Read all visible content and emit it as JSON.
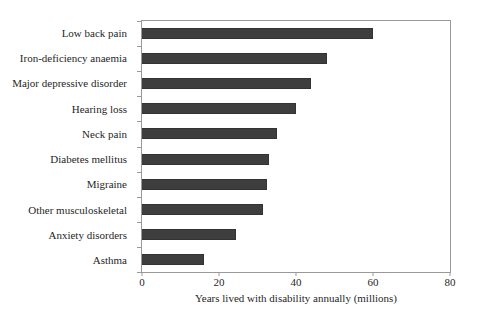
{
  "figure": {
    "background": "#ffffff",
    "text_color": "#1f1f1f"
  },
  "chart_data": {
    "type": "bar",
    "orientation": "horizontal",
    "title": "",
    "xlabel": "Years lived with disability annually (millions)",
    "ylabel": "",
    "categories": [
      "Low back pain",
      "Iron-deficiency anaemia",
      "Major depressive disorder",
      "Hearing loss",
      "Neck pain",
      "Diabetes mellitus",
      "Migraine",
      "Other musculoskeletal",
      "Anxiety disorders",
      "Asthma"
    ],
    "values": [
      60,
      48,
      44,
      40,
      35,
      33,
      32.5,
      31.5,
      24.5,
      16
    ],
    "xlim": [
      0,
      80
    ],
    "xticks": [
      0,
      20,
      40,
      60,
      80
    ],
    "grid": false,
    "legend": null,
    "bar_color": "#3e3e3e",
    "bar_border_color": "#333333",
    "axis_color": "#999999"
  }
}
